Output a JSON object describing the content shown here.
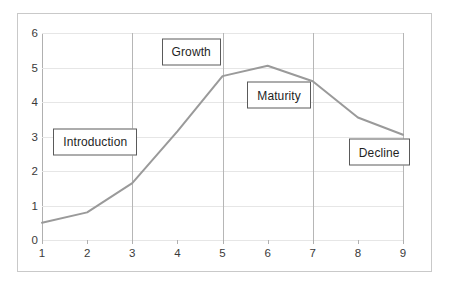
{
  "chart_data": {
    "type": "line",
    "title": "",
    "xlabel": "",
    "ylabel": "",
    "x": [
      1,
      2,
      3,
      4,
      5,
      6,
      7,
      8,
      9
    ],
    "values": [
      0.5,
      0.8,
      1.65,
      3.15,
      4.75,
      5.05,
      4.6,
      3.55,
      3.05
    ],
    "series": [
      {
        "name": "Product life cycle",
        "values": [
          0.5,
          0.8,
          1.65,
          3.15,
          4.75,
          5.05,
          4.6,
          3.55,
          3.05
        ],
        "color": "#9a9a9a"
      }
    ],
    "xlim": [
      1,
      9
    ],
    "ylim": [
      0,
      6
    ],
    "x_ticks": [
      "1",
      "2",
      "3",
      "4",
      "5",
      "6",
      "7",
      "8",
      "9"
    ],
    "y_ticks": [
      "0",
      "1",
      "2",
      "3",
      "4",
      "5",
      "6"
    ],
    "grid": true,
    "legend": "none",
    "stage_dividers": [
      3,
      5,
      7,
      9
    ],
    "annotations": [
      {
        "label": "Introduction",
        "x": 1.25,
        "y": 2.85
      },
      {
        "label": "Growth",
        "x": 3.65,
        "y": 5.45
      },
      {
        "label": "Maturity",
        "x": 5.55,
        "y": 4.2
      },
      {
        "label": "Decline",
        "x": 7.8,
        "y": 2.55
      }
    ],
    "colors": {
      "line": "#9a9a9a",
      "grid": "#e6e6e6",
      "axis": "#b0b0b0",
      "divider": "#b6b6b6",
      "box_border": "#5a5a5a",
      "frame": "#c9c9c9",
      "text": "#3a3a3a",
      "background": "#ffffff"
    }
  }
}
